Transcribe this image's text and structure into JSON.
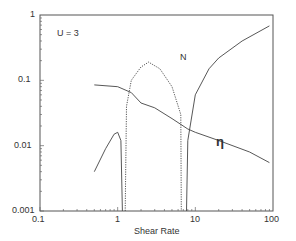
{
  "chart_data": {
    "type": "line",
    "title": "",
    "annotation": "U = 3",
    "xlabel": "Shear Rate",
    "ylabel": "",
    "xscale": "log",
    "yscale": "log",
    "xlim": [
      0.1,
      100
    ],
    "ylim": [
      0.001,
      1
    ],
    "xticks": [
      "0.1",
      "1",
      "10",
      "100"
    ],
    "yticks": [
      "0.001",
      "0.01",
      "0.1",
      "1"
    ],
    "series": [
      {
        "name": "N",
        "style": "solid",
        "segment": "low",
        "x": [
          0.5,
          0.7,
          0.9,
          1.0,
          1.1,
          1.15
        ],
        "y": [
          0.004,
          0.009,
          0.015,
          0.016,
          0.012,
          0.001
        ]
      },
      {
        "name": "N",
        "style": "dotted",
        "x": [
          1.25,
          1.3,
          1.5,
          2.0,
          2.5,
          3.5,
          5.0,
          6.5,
          6.6
        ],
        "y": [
          0.001,
          0.04,
          0.1,
          0.16,
          0.19,
          0.15,
          0.08,
          0.03,
          0.001
        ]
      },
      {
        "name": "N",
        "style": "solid",
        "segment": "high",
        "x": [
          7.7,
          8.0,
          10,
          15,
          20,
          40,
          90
        ],
        "y": [
          0.001,
          0.012,
          0.06,
          0.15,
          0.22,
          0.4,
          0.68
        ]
      },
      {
        "name": "eta",
        "label": "η",
        "style": "solid",
        "x": [
          0.5,
          1,
          1.5,
          2,
          3,
          5,
          8,
          10,
          20,
          50,
          90
        ],
        "y": [
          0.085,
          0.08,
          0.065,
          0.045,
          0.038,
          0.026,
          0.018,
          0.016,
          0.012,
          0.008,
          0.0055
        ]
      }
    ],
    "curve_labels": [
      {
        "text": "N",
        "x": 4.2,
        "y": 0.22
      },
      {
        "text": "η",
        "x": 22,
        "y": 0.011
      }
    ]
  },
  "labels": {
    "annotation": "U = 3",
    "xlabel": "Shear Rate",
    "N": "N",
    "eta": "η"
  },
  "ticks": {
    "x": [
      "0.1",
      "1",
      "10",
      "100"
    ],
    "y": [
      "1",
      "0.1",
      "0.01",
      "0.001"
    ]
  }
}
